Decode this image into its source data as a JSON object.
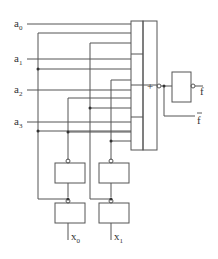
{
  "diagram": {
    "type": "logic-circuit",
    "inputs": [
      {
        "name": "a",
        "sub": "0"
      },
      {
        "name": "a",
        "sub": "1"
      },
      {
        "name": "a",
        "sub": "2"
      },
      {
        "name": "a",
        "sub": "3"
      }
    ],
    "select_inputs": [
      {
        "name": "x",
        "sub": "0"
      },
      {
        "name": "x",
        "sub": "1"
      }
    ],
    "or_gate_symbol": "+",
    "outputs": [
      {
        "name": "f",
        "overbar": false
      },
      {
        "name": "f",
        "overbar": true
      }
    ],
    "colors": {
      "line": "#555555",
      "background": "#ffffff"
    }
  }
}
